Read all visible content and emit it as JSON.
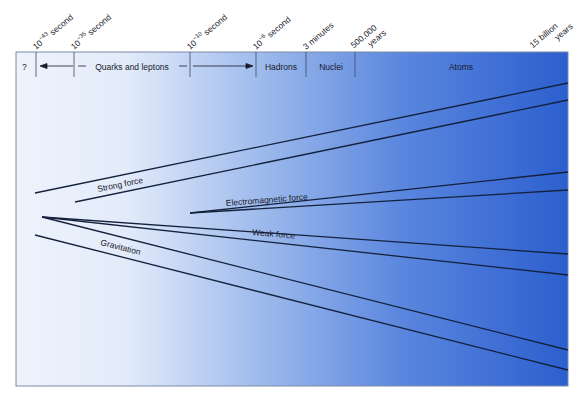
{
  "diagram": {
    "time_labels": [
      {
        "text": "10",
        "exp": "−43",
        "unit": " second"
      },
      {
        "text": "10",
        "exp": "−35",
        "unit": " second"
      },
      {
        "text": "10",
        "exp": "−10",
        "unit": " second"
      },
      {
        "text": "10",
        "exp": "−6",
        "unit": " second"
      },
      {
        "text": "3 minutes"
      },
      {
        "line1": "500,000",
        "line2": "years"
      },
      {
        "line1": "15 billion",
        "line2": "years"
      }
    ],
    "eras": [
      {
        "label": "?"
      },
      {
        "label": "Quarks and leptons"
      },
      {
        "label": "Hadrons"
      },
      {
        "label": "Nuclei"
      },
      {
        "label": "Atoms"
      }
    ],
    "forces": [
      {
        "label": "Strong force"
      },
      {
        "label": "Electromagnetic force"
      },
      {
        "label": "Weak force"
      },
      {
        "label": "Gravitation"
      }
    ],
    "colors": {
      "gradient_start": "#f2f6fd",
      "gradient_mid": "#8fb0e8",
      "gradient_end": "#2f62cf",
      "line": "#14213d"
    }
  }
}
